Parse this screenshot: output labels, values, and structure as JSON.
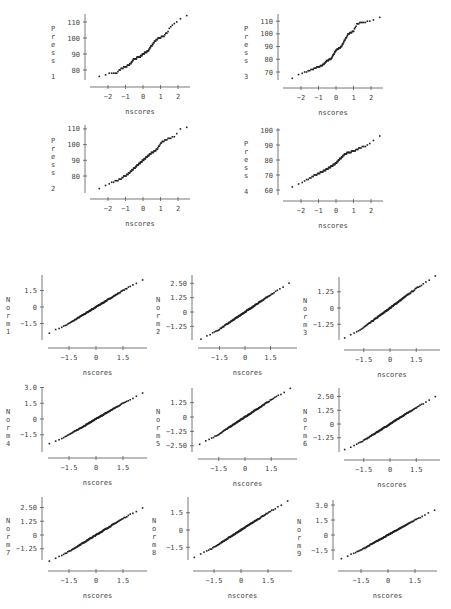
{
  "chart_data": [
    {
      "id": "press1",
      "type": "scatter",
      "title": "",
      "xlabel": "nscores",
      "ylabel": "Press",
      "ylabel_index": "1",
      "x_ticks": [
        -2,
        -1,
        0,
        1,
        2
      ],
      "y_ticks": [
        80,
        90,
        100,
        110
      ],
      "x_range": [
        -2.7,
        2.6
      ],
      "y_range": [
        75,
        114
      ],
      "quantiles": [
        [
          -2.7,
          75.5
        ],
        [
          -2.4,
          76.5
        ],
        [
          -2.2,
          77
        ],
        [
          -2,
          77.5
        ],
        [
          -1.5,
          78.5
        ],
        [
          -1.2,
          81
        ],
        [
          -0.8,
          83
        ],
        [
          -0.5,
          87
        ],
        [
          -0.2,
          88
        ],
        [
          0,
          90
        ],
        [
          0.3,
          92
        ],
        [
          0.6,
          97
        ],
        [
          0.9,
          100
        ],
        [
          1.2,
          101
        ],
        [
          1.4,
          104
        ],
        [
          1.6,
          107
        ],
        [
          2.0,
          111
        ],
        [
          2.3,
          113
        ],
        [
          2.5,
          114
        ]
      ],
      "frame": {
        "x0": 85,
        "y_axis_top": 14,
        "y_axis_bottom": 80,
        "x_axis_y": 87,
        "x_left": 90,
        "x_right": 190,
        "px0": 143,
        "pxu": 17.5,
        "py_ref": [
          80,
          70
        ],
        "pyu": 1.6
      }
    },
    {
      "id": "press3",
      "type": "scatter",
      "title": "",
      "xlabel": "nscores",
      "ylabel": "Press",
      "ylabel_index": "3",
      "x_ticks": [
        -2,
        -1,
        0,
        1,
        2
      ],
      "y_ticks": [
        70,
        80,
        90,
        100,
        110
      ],
      "x_range": [
        -2.8,
        2.5
      ],
      "y_range": [
        65,
        113
      ],
      "quantiles": [
        [
          -2.8,
          65
        ],
        [
          -2.4,
          65
        ],
        [
          -2.1,
          68
        ],
        [
          -1.7,
          70
        ],
        [
          -1.2,
          73
        ],
        [
          -0.8,
          75
        ],
        [
          -0.5,
          79
        ],
        [
          -0.3,
          80
        ],
        [
          0,
          87
        ],
        [
          0.3,
          90
        ],
        [
          0.5,
          95
        ],
        [
          0.7,
          100
        ],
        [
          1.0,
          102
        ],
        [
          1.2,
          108
        ],
        [
          1.5,
          109
        ],
        [
          1.9,
          110
        ],
        [
          2.2,
          111
        ],
        [
          2.5,
          113
        ]
      ],
      "frame": {
        "x0": 278,
        "y_axis_top": 14,
        "y_axis_bottom": 80,
        "x_axis_y": 88,
        "x_left": 283,
        "x_right": 383,
        "px0": 336,
        "pxu": 17.5,
        "py_ref": [
          70,
          72
        ],
        "pyu": 1.27
      }
    },
    {
      "id": "press2",
      "type": "scatter",
      "title": "",
      "xlabel": "nscores",
      "ylabel": "Press",
      "ylabel_index": "2",
      "x_ticks": [
        -2,
        -1,
        0,
        1,
        2
      ],
      "y_ticks": [
        80,
        90,
        100,
        110
      ],
      "x_range": [
        -2.8,
        2.4
      ],
      "y_range": [
        72,
        111
      ],
      "quantiles": [
        [
          -2.8,
          72
        ],
        [
          -2.4,
          72.5
        ],
        [
          -2.1,
          74
        ],
        [
          -1.8,
          76
        ],
        [
          -1.3,
          78
        ],
        [
          -0.9,
          81
        ],
        [
          -0.5,
          85
        ],
        [
          0,
          90
        ],
        [
          0.4,
          94
        ],
        [
          0.8,
          97
        ],
        [
          1.1,
          102
        ],
        [
          1.5,
          104
        ],
        [
          1.9,
          106
        ],
        [
          2.1,
          110
        ],
        [
          2.4,
          111
        ]
      ],
      "frame": {
        "x0": 85,
        "y_axis_top": 125,
        "y_axis_bottom": 193,
        "x_axis_y": 199,
        "x_left": 90,
        "x_right": 190,
        "px0": 143,
        "pxu": 17.5,
        "py_ref": [
          80,
          176
        ],
        "pyu": 1.57
      }
    },
    {
      "id": "press4",
      "type": "scatter",
      "title": "",
      "xlabel": "nscores",
      "ylabel": "Press",
      "ylabel_index": "4",
      "x_ticks": [
        -2,
        -1,
        0,
        1,
        2
      ],
      "y_ticks": [
        60,
        70,
        80,
        90,
        100
      ],
      "x_range": [
        -2.7,
        2.5
      ],
      "y_range": [
        62,
        96
      ],
      "quantiles": [
        [
          -2.7,
          62
        ],
        [
          -2.3,
          62
        ],
        [
          -2,
          65
        ],
        [
          -1.5,
          68
        ],
        [
          -1,
          71
        ],
        [
          -0.5,
          74
        ],
        [
          0,
          78
        ],
        [
          0.5,
          84
        ],
        [
          1.0,
          86
        ],
        [
          1.4,
          88
        ],
        [
          1.8,
          90
        ],
        [
          2.1,
          93
        ],
        [
          2.5,
          96
        ]
      ],
      "frame": {
        "x0": 278,
        "y_axis_top": 128,
        "y_axis_bottom": 195,
        "x_axis_y": 201,
        "x_left": 283,
        "x_right": 383,
        "px0": 336,
        "pxu": 17.5,
        "py_ref": [
          60,
          190
        ],
        "pyu": 1.5
      }
    },
    {
      "id": "norm1",
      "type": "scatter",
      "xlabel": "nscores",
      "ylabel": "Norm",
      "ylabel_index": "1",
      "x_ticks": [
        -1.5,
        0,
        1.5
      ],
      "y_ticks": [
        1.5,
        0,
        -1.5
      ],
      "x_range": [
        -2.6,
        2.7
      ],
      "y_range": [
        -2.7,
        2.7
      ],
      "frame": {
        "x0": 42,
        "y_axis_top": 275,
        "y_axis_bottom": 340,
        "x_axis_y": 348,
        "x_left": 48,
        "x_right": 147,
        "px0": 96,
        "pxu": 18,
        "py0": 307,
        "pyu": 11
      }
    },
    {
      "id": "norm2",
      "type": "scatter",
      "xlabel": "nscores",
      "ylabel": "Norm",
      "ylabel_index": "2",
      "x_ticks": [
        -1.5,
        0,
        1.5
      ],
      "y_ticks": [
        2.5,
        1.25,
        0,
        -1.25
      ],
      "x_range": [
        -2.6,
        2.7
      ],
      "y_range": [
        -2.7,
        3.2
      ],
      "frame": {
        "x0": 192,
        "y_axis_top": 275,
        "y_axis_bottom": 340,
        "x_axis_y": 348,
        "x_left": 198,
        "x_right": 297,
        "px0": 245,
        "pxu": 17,
        "py0": 312,
        "pyu": 11.5
      }
    },
    {
      "id": "norm3",
      "type": "scatter",
      "xlabel": "nscores",
      "ylabel": "Norm",
      "ylabel_index": "3",
      "x_ticks": [
        -1.5,
        0,
        1.5
      ],
      "y_ticks": [
        1.25,
        0,
        -1.25
      ],
      "x_range": [
        -2.6,
        2.7
      ],
      "y_range": [
        -2.6,
        2.6
      ],
      "frame": {
        "x0": 339,
        "y_axis_top": 277,
        "y_axis_bottom": 340,
        "x_axis_y": 350,
        "x_left": 344,
        "x_right": 440,
        "px0": 390,
        "pxu": 17.5,
        "py0": 308,
        "pyu": 13
      }
    },
    {
      "id": "norm4",
      "type": "scatter",
      "xlabel": "nscores",
      "ylabel": "Norm",
      "ylabel_index": "4",
      "x_ticks": [
        -1.5,
        0,
        1.5
      ],
      "y_ticks": [
        3.0,
        1.5,
        0,
        -1.5
      ],
      "x_range": [
        -2.6,
        2.7
      ],
      "y_range": [
        -3.1,
        3.1
      ],
      "frame": {
        "x0": 42,
        "y_axis_top": 387,
        "y_axis_bottom": 452,
        "x_axis_y": 458,
        "x_left": 48,
        "x_right": 147,
        "px0": 96,
        "pxu": 18,
        "py0": 419,
        "pyu": 10.5
      }
    },
    {
      "id": "norm5",
      "type": "scatter",
      "xlabel": "nscores",
      "ylabel": "Norm",
      "ylabel_index": "5",
      "x_ticks": [
        -1.5,
        0,
        1.5
      ],
      "y_ticks": [
        1.25,
        0,
        -1.25,
        -2.5
      ],
      "x_range": [
        -2.6,
        2.7
      ],
      "y_range": [
        -2.8,
        2.6
      ],
      "frame": {
        "x0": 192,
        "y_axis_top": 388,
        "y_axis_bottom": 452,
        "x_axis_y": 459,
        "x_left": 198,
        "x_right": 297,
        "px0": 245,
        "pxu": 17.5,
        "py0": 417,
        "pyu": 11.5
      }
    },
    {
      "id": "norm6",
      "type": "scatter",
      "xlabel": "nscores",
      "ylabel": "Norm",
      "ylabel_index": "6",
      "x_ticks": [
        -1.5,
        0,
        1.5
      ],
      "y_ticks": [
        2.5,
        1.25,
        0,
        -1.25
      ],
      "x_range": [
        -2.6,
        2.7
      ],
      "y_range": [
        -2.7,
        3.1
      ],
      "frame": {
        "x0": 339,
        "y_axis_top": 388,
        "y_axis_bottom": 452,
        "x_axis_y": 460,
        "x_left": 344,
        "x_right": 440,
        "px0": 390,
        "pxu": 17.5,
        "py0": 424,
        "pyu": 11
      }
    },
    {
      "id": "norm7",
      "type": "scatter",
      "xlabel": "nscores",
      "ylabel": "Norm",
      "ylabel_index": "7",
      "x_ticks": [
        -1.5,
        0,
        1.5
      ],
      "y_ticks": [
        2.5,
        1.25,
        0,
        -1.25
      ],
      "x_range": [
        -2.6,
        2.7
      ],
      "y_range": [
        -2.6,
        3.3
      ],
      "frame": {
        "x0": 42,
        "y_axis_top": 497,
        "y_axis_bottom": 560,
        "x_axis_y": 571,
        "x_left": 48,
        "x_right": 147,
        "px0": 96,
        "pxu": 18,
        "py0": 535,
        "pyu": 11
      }
    },
    {
      "id": "norm8",
      "type": "scatter",
      "xlabel": "nscores",
      "ylabel": "Norm",
      "ylabel_index": "8",
      "x_ticks": [
        -1.5,
        0,
        1.5
      ],
      "y_ticks": [
        1.5,
        0,
        -1.5
      ],
      "x_range": [
        -2.6,
        2.7
      ],
      "y_range": [
        -2.7,
        2.7
      ],
      "frame": {
        "x0": 188,
        "y_axis_top": 497,
        "y_axis_bottom": 560,
        "x_axis_y": 571,
        "x_left": 193,
        "x_right": 292,
        "px0": 241,
        "pxu": 18,
        "py0": 530,
        "pyu": 11.5
      }
    },
    {
      "id": "norm9",
      "type": "scatter",
      "xlabel": "nscores",
      "ylabel": "Norm",
      "ylabel_index": "9",
      "x_ticks": [
        -1.5,
        0,
        1.5
      ],
      "y_ticks": [
        3.0,
        1.5,
        0,
        -1.5
      ],
      "x_range": [
        -2.6,
        2.7
      ],
      "y_range": [
        -2.6,
        3.4
      ],
      "frame": {
        "x0": 333,
        "y_axis_top": 500,
        "y_axis_bottom": 560,
        "x_axis_y": 571,
        "x_left": 338,
        "x_right": 437,
        "px0": 388,
        "pxu": 18,
        "py0": 535,
        "pyu": 10
      }
    }
  ]
}
